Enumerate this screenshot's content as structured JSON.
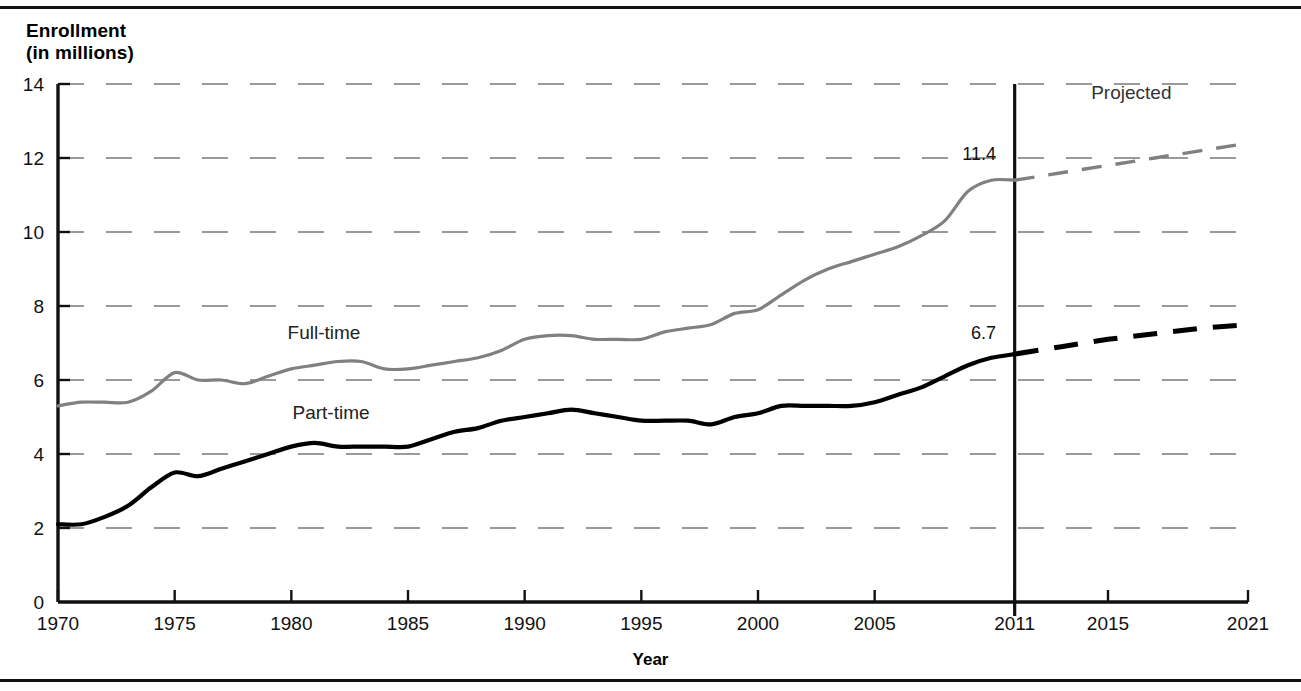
{
  "figure": {
    "y_axis_title": "Enrollment\n(in millions)",
    "x_axis_title": "Year",
    "projected_label": "Projected"
  },
  "chart_data": {
    "type": "line",
    "title": "",
    "subtitle": "",
    "xlabel": "Year",
    "ylabel": "Enrollment (in millions)",
    "xlim": [
      1970,
      2021
    ],
    "ylim": [
      0,
      14
    ],
    "grid": true,
    "grid_axis": "y",
    "legend": "inline-labels",
    "x_tick_labels": [
      "1970",
      "1975",
      "1980",
      "1985",
      "1990",
      "1995",
      "2000",
      "2005",
      "2011",
      "2015",
      "2021"
    ],
    "x_ticks": [
      1970,
      1975,
      1980,
      1985,
      1990,
      1995,
      2000,
      2005,
      2011,
      2015,
      2021
    ],
    "y_tick_labels": [
      "0",
      "2",
      "4",
      "6",
      "8",
      "10",
      "12",
      "14"
    ],
    "y_ticks": [
      0,
      2,
      4,
      6,
      8,
      10,
      12,
      14
    ],
    "annotations": [
      {
        "text": "Projected",
        "x": 2016,
        "y": 13.6
      },
      {
        "text": "Full-time",
        "x": 1981.4,
        "y": 7.1
      },
      {
        "text": "Part-time",
        "x": 1981.7,
        "y": 4.95
      },
      {
        "text": "11.4",
        "x": 2010.2,
        "y": 11.95
      },
      {
        "text": "6.7",
        "x": 2010.2,
        "y": 7.12
      }
    ],
    "series": [
      {
        "name": "Full-time",
        "color": "#808080",
        "style": "solid",
        "x": [
          1970,
          1971,
          1972,
          1973,
          1974,
          1975,
          1976,
          1977,
          1978,
          1979,
          1980,
          1981,
          1982,
          1983,
          1984,
          1985,
          1986,
          1987,
          1988,
          1989,
          1990,
          1991,
          1992,
          1993,
          1994,
          1995,
          1996,
          1997,
          1998,
          1999,
          2000,
          2001,
          2002,
          2003,
          2004,
          2005,
          2006,
          2007,
          2008,
          2009,
          2010,
          2011
        ],
        "values": [
          5.3,
          5.4,
          5.4,
          5.4,
          5.7,
          6.2,
          6.0,
          6.0,
          5.9,
          6.1,
          6.3,
          6.4,
          6.5,
          6.5,
          6.3,
          6.3,
          6.4,
          6.5,
          6.6,
          6.8,
          7.1,
          7.2,
          7.2,
          7.1,
          7.1,
          7.1,
          7.3,
          7.4,
          7.5,
          7.8,
          7.9,
          8.3,
          8.7,
          9.0,
          9.2,
          9.4,
          9.6,
          9.9,
          10.3,
          11.1,
          11.4,
          11.4
        ]
      },
      {
        "name": "Full-time (projected)",
        "color": "#808080",
        "style": "dashed",
        "x": [
          2011,
          2013,
          2015,
          2017,
          2019,
          2021
        ],
        "values": [
          11.4,
          11.6,
          11.8,
          12.0,
          12.2,
          12.4
        ]
      },
      {
        "name": "Part-time",
        "color": "#000000",
        "style": "solid",
        "x": [
          1970,
          1971,
          1972,
          1973,
          1974,
          1975,
          1976,
          1977,
          1978,
          1979,
          1980,
          1981,
          1982,
          1983,
          1984,
          1985,
          1986,
          1987,
          1988,
          1989,
          1990,
          1991,
          1992,
          1993,
          1994,
          1995,
          1996,
          1997,
          1998,
          1999,
          2000,
          2001,
          2002,
          2003,
          2004,
          2005,
          2006,
          2007,
          2008,
          2009,
          2010,
          2011
        ],
        "values": [
          2.1,
          2.1,
          2.3,
          2.6,
          3.1,
          3.5,
          3.4,
          3.6,
          3.8,
          4.0,
          4.2,
          4.3,
          4.2,
          4.2,
          4.2,
          4.2,
          4.4,
          4.6,
          4.7,
          4.9,
          5.0,
          5.1,
          5.2,
          5.1,
          5.0,
          4.9,
          4.9,
          4.9,
          4.8,
          5.0,
          5.1,
          5.3,
          5.3,
          5.3,
          5.3,
          5.4,
          5.6,
          5.8,
          6.1,
          6.4,
          6.6,
          6.7
        ]
      },
      {
        "name": "Part-time (projected)",
        "color": "#000000",
        "style": "dashed",
        "x": [
          2011,
          2013,
          2015,
          2017,
          2019,
          2021
        ],
        "values": [
          6.7,
          6.9,
          7.1,
          7.25,
          7.4,
          7.5
        ]
      }
    ]
  }
}
